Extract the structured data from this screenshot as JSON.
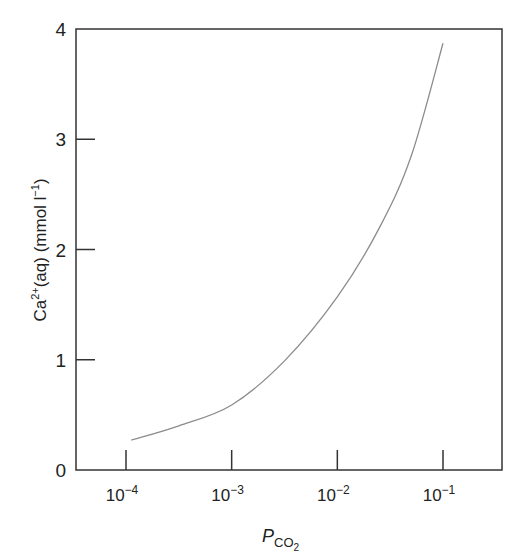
{
  "chart_data": {
    "type": "line",
    "title": "",
    "xlabel": "P_CO2",
    "xlabel_main": "P",
    "xlabel_sub": "CO",
    "xlabel_subsub": "2",
    "ylabel": "Ca2+(aq) (mmol l-1)",
    "ylabel_parts": {
      "a": "Ca",
      "sup": "2+",
      "b": "(aq) (mmol l",
      "sup2": "−1",
      "c": ")"
    },
    "xscale": "log",
    "xlim": [
      3e-05,
      0.2
    ],
    "ylim": [
      0,
      4
    ],
    "grid": false,
    "legend": "none",
    "x_ticks": [
      {
        "exp": -4,
        "base": "10",
        "power": "−4"
      },
      {
        "exp": -3,
        "base": "10",
        "power": "−3"
      },
      {
        "exp": -2,
        "base": "10",
        "power": "−2"
      },
      {
        "exp": -1,
        "base": "10",
        "power": "−1"
      }
    ],
    "y_ticks": [
      "0",
      "1",
      "2",
      "3",
      "4"
    ],
    "series": [
      {
        "name": "Ca2+(aq) vs P_CO2",
        "color": "#8c8c8c",
        "x": [
          0.00011,
          0.0003,
          0.001,
          0.003,
          0.01,
          0.025,
          0.05,
          0.1
        ],
        "log10_x": [
          -3.95,
          -3.5,
          -3.0,
          -2.5,
          -2.0,
          -1.6,
          -1.3,
          -1.0
        ],
        "values": [
          0.27,
          0.4,
          0.59,
          0.99,
          1.57,
          2.2,
          2.85,
          3.87
        ]
      }
    ]
  }
}
